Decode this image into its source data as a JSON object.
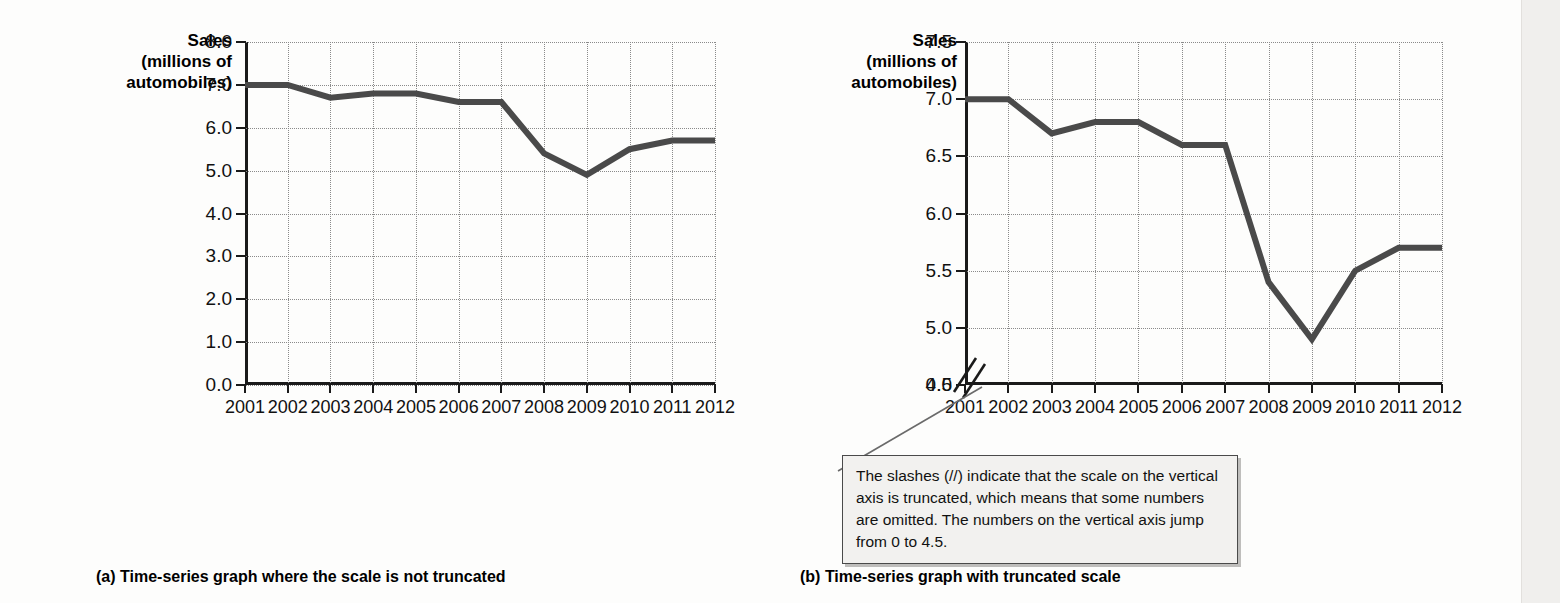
{
  "chart_data": [
    {
      "id": "untruncated",
      "type": "line",
      "title": "",
      "axis_title_lines": [
        "Sales",
        "(millions of",
        "automobiles)"
      ],
      "ylabel": "Sales (millions of automobiles)",
      "xlabel": "",
      "categories": [
        "2001",
        "2002",
        "2003",
        "2004",
        "2005",
        "2006",
        "2007",
        "2008",
        "2009",
        "2010",
        "2011",
        "2012"
      ],
      "values": [
        7.0,
        7.0,
        6.7,
        6.8,
        6.8,
        6.6,
        6.6,
        5.4,
        4.9,
        5.5,
        5.7,
        5.7
      ],
      "ylim": [
        0.0,
        8.0
      ],
      "yticks": [
        "0.0",
        "1.0",
        "2.0",
        "3.0",
        "4.0",
        "5.0",
        "6.0",
        "7.0",
        "8.0"
      ],
      "ytick_values": [
        0.0,
        1.0,
        2.0,
        3.0,
        4.0,
        5.0,
        6.0,
        7.0,
        8.0
      ],
      "truncated": false,
      "grid": true,
      "legend": "none",
      "series_color": "#4a4a4a",
      "caption": "(a) Time-series graph where the scale is not truncated"
    },
    {
      "id": "truncated",
      "type": "line",
      "title": "",
      "axis_title_lines": [
        "Sales",
        "(millions of",
        "automobiles)"
      ],
      "ylabel": "Sales (millions of automobiles)",
      "xlabel": "",
      "categories": [
        "2001",
        "2002",
        "2003",
        "2004",
        "2005",
        "2006",
        "2007",
        "2008",
        "2009",
        "2010",
        "2011",
        "2012"
      ],
      "values": [
        7.0,
        7.0,
        6.7,
        6.8,
        6.8,
        6.6,
        6.6,
        5.4,
        4.9,
        5.5,
        5.7,
        5.7
      ],
      "ylim": [
        4.5,
        7.5
      ],
      "yticks": [
        "0.0",
        "4.5",
        "5.0",
        "5.5",
        "6.0",
        "6.5",
        "7.0",
        "7.5"
      ],
      "ytick_values": [
        4.5,
        5.0,
        5.5,
        6.0,
        6.5,
        7.0,
        7.5
      ],
      "baseline_tick": "0.0",
      "truncated": true,
      "truncation_symbol": "//",
      "grid": true,
      "legend": "none",
      "series_color": "#4a4a4a",
      "caption": "(b) Time-series graph with truncated scale"
    }
  ],
  "callout": {
    "text": "The slashes (//) indicate that the scale on the vertical axis is truncated, which means that some numbers are omitted.  The numbers on the vertical axis jump from 0 to 4.5.",
    "border_color": "#4a4a4a",
    "background_color": "#f2f1ef"
  },
  "colors": {
    "series": "#4a4a4a",
    "axis": "#1a1a1a",
    "grid": "#8a8a8a",
    "text": "#111111"
  }
}
